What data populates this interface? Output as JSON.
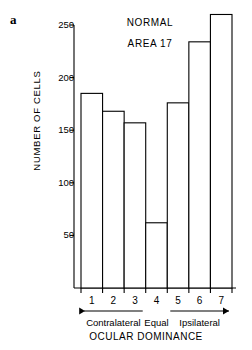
{
  "panel": {
    "label": "a"
  },
  "chart_data": {
    "type": "bar",
    "title": "NORMAL",
    "subtitle": "AREA 17",
    "xlabel": "OCULAR DOMINANCE",
    "ylabel": "NUMBER OF CELLS",
    "categories": [
      "1",
      "2",
      "3",
      "4",
      "5",
      "6",
      "7"
    ],
    "values": [
      185,
      168,
      157,
      62,
      176,
      234,
      260
    ],
    "ylim": [
      0,
      265
    ],
    "yticks": [
      50,
      100,
      150,
      200,
      250
    ],
    "ytick_labels": [
      "50",
      "100",
      "150",
      "200",
      "250"
    ],
    "grid": false,
    "legend": null,
    "annotations": [
      {
        "name": "contralateral",
        "text": "Contralateral",
        "arrow": "left",
        "categories": [
          "1",
          "2",
          "3"
        ]
      },
      {
        "name": "equal",
        "text": "Equal",
        "arrow": "none",
        "categories": [
          "4"
        ]
      },
      {
        "name": "ipsilateral",
        "text": "Ipsilateral",
        "arrow": "right",
        "categories": [
          "5",
          "6",
          "7"
        ]
      }
    ],
    "colors": {
      "bar_fill": "#ffffff",
      "bar_stroke": "#000000",
      "axis": "#000000"
    }
  }
}
